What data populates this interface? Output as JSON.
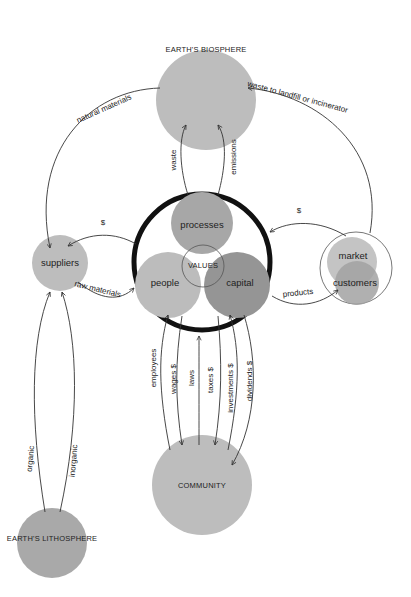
{
  "colors": {
    "background": "#ffffff",
    "light_gray": "#bdbdbd",
    "mid_gray": "#a9a9a9",
    "dark_gray": "#939393",
    "ring": "#111111",
    "line": "#333333"
  },
  "nodes": {
    "biosphere": "EARTH'S BIOSPHERE",
    "lithosphere": "EARTH'S LITHOSPHERE",
    "community": "COMMUNITY",
    "suppliers": "suppliers",
    "processes": "processes",
    "people": "people",
    "capital": "capital",
    "values": "VALUES",
    "market": "market",
    "customers": "customers"
  },
  "flows": {
    "natural_materials": "natural materials",
    "waste_to_landfill": "waste to landfill or incinerator",
    "waste": "waste",
    "emissions": "emissions",
    "supplier_payment": "$",
    "market_payment": "$",
    "raw_materials": "raw materials",
    "products": "products",
    "employees": "employees",
    "wages": "wages $",
    "laws": "laws",
    "taxes": "taxes $",
    "investments": "investments $",
    "dividends": "dividends $",
    "organic": "organic",
    "inorganic": "inorganic"
  }
}
